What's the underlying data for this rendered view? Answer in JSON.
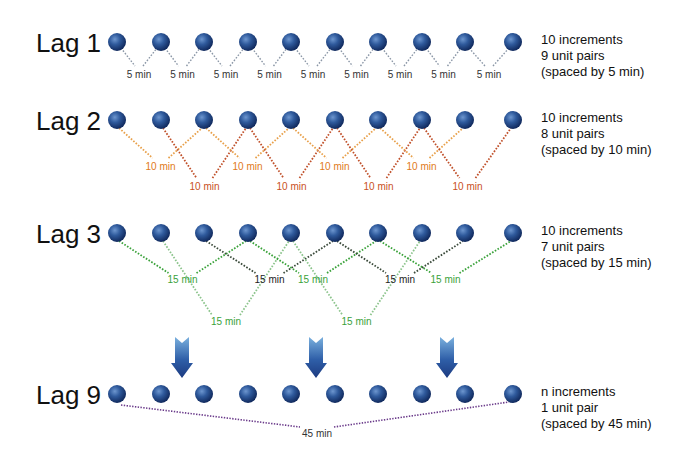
{
  "colors": {
    "ball_dark": "#14306a",
    "ball_light": "#5a86c4",
    "lag1_line": "#8a96a6",
    "lag2_light": "#e8a04a",
    "lag2_dark": "#c0502a",
    "lag2_label": "#e07a20",
    "lag2_label_dark": "#c8501c",
    "lag3_green": "#3aa23a",
    "lag3_light": "#8cc48c",
    "lag3_dark": "#3a4a3a",
    "lag9_line": "#6a3a8a",
    "arrow": "#2a4a8a"
  },
  "ball_x": [
    117,
    161,
    204,
    248,
    291,
    335,
    378,
    422,
    465,
    513
  ],
  "rows": [
    {
      "id": "lag1",
      "label": "Lag 1",
      "y": 42,
      "desc": [
        "10 increments",
        "9 unit pairs",
        "(spaced by 5 min)"
      ],
      "pair_label": "5 min"
    },
    {
      "id": "lag2",
      "label": "Lag 2",
      "y": 120,
      "desc": [
        "10 increments",
        "8 unit pairs",
        "(spaced by 10 min)"
      ],
      "pair_label": "10 min"
    },
    {
      "id": "lag3",
      "label": "Lag 3",
      "y": 233,
      "desc": [
        "10 increments",
        "7 unit pairs",
        "(spaced by 15 min)"
      ],
      "pair_label": "15 min"
    },
    {
      "id": "lag9",
      "label": "Lag 9",
      "y": 394,
      "desc": [
        "n increments",
        "1 unit pair",
        "(spaced by 45 min)"
      ],
      "pair_label": "45 min"
    }
  ],
  "arrows_x": [
    182,
    316,
    447
  ]
}
